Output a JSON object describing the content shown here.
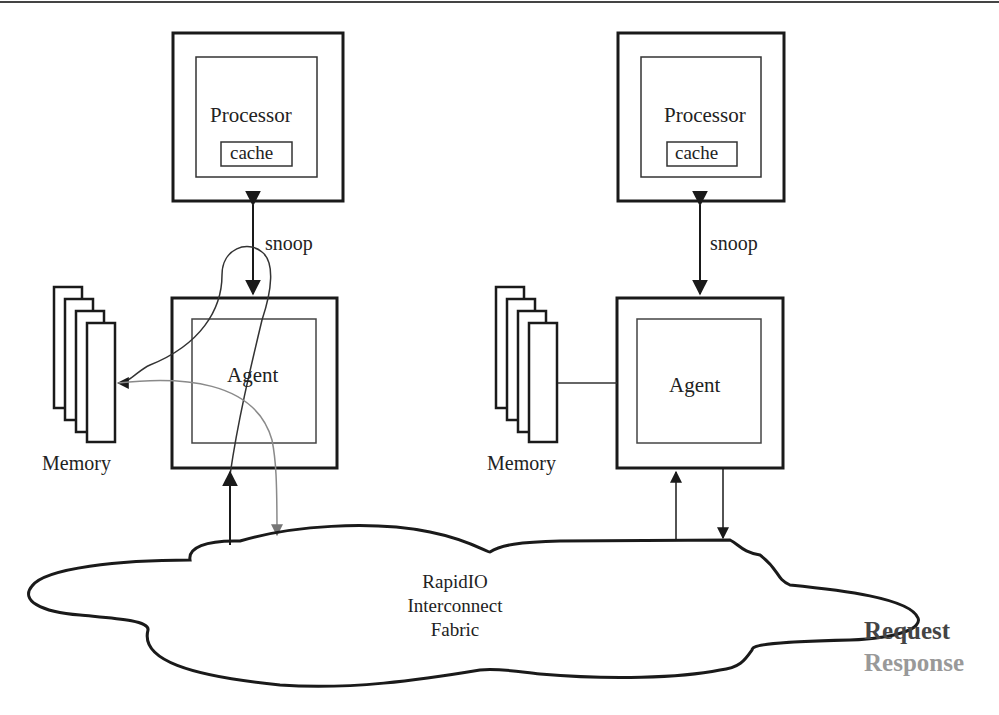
{
  "diagram": {
    "type": "system-architecture",
    "nodes": {
      "left": {
        "processor": {
          "label": "Processor",
          "cache_label": "cache"
        },
        "snoop_label": "snoop",
        "agent": {
          "label": "Agent"
        },
        "memory": {
          "label": "Memory",
          "banks": 4
        }
      },
      "right": {
        "processor": {
          "label": "Processor",
          "cache_label": "cache"
        },
        "snoop_label": "snoop",
        "agent": {
          "label": "Agent"
        },
        "memory": {
          "label": "Memory",
          "banks": 4
        }
      },
      "fabric": {
        "line1": "RapidIO",
        "line2": "Interconnect",
        "line3": "Fabric"
      }
    },
    "legend": {
      "request": {
        "label": "Request",
        "color": "#444444"
      },
      "response": {
        "label": "Response",
        "color": "#999999"
      }
    },
    "colors": {
      "stroke": "#1a1a1a",
      "response_stroke": "#8a8a8a",
      "background": "#ffffff"
    }
  }
}
